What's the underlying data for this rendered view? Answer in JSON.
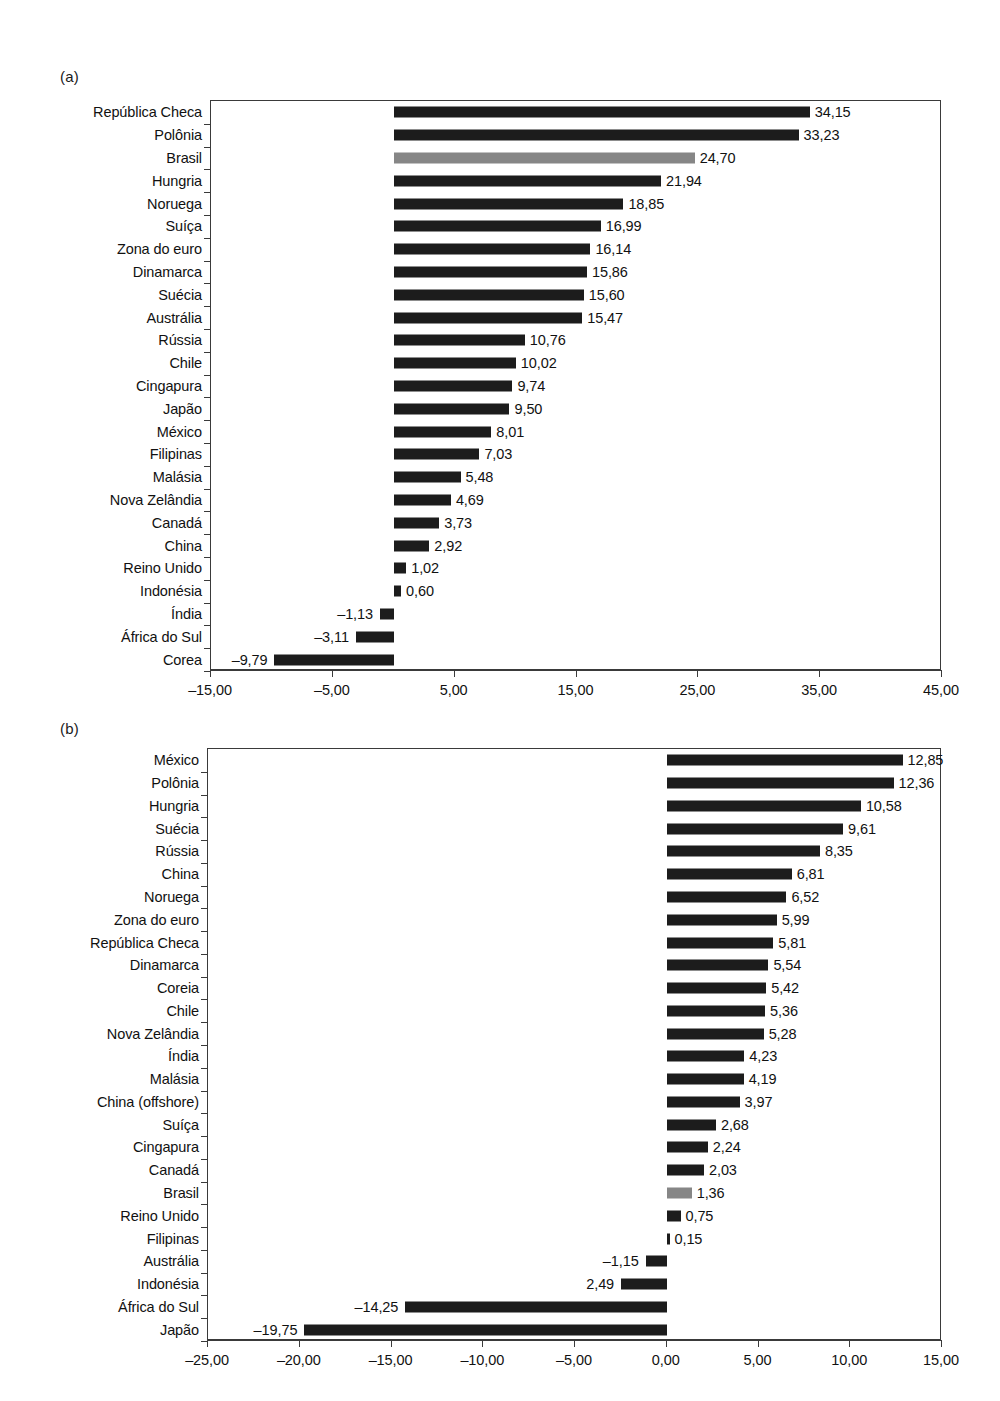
{
  "chart_data": [
    {
      "panel": "(a)",
      "type": "bar",
      "orientation": "horizontal",
      "title": "",
      "xlabel": "",
      "ylabel": "",
      "xlim": [
        -15.0,
        45.0
      ],
      "xticks": [
        -15.0,
        -5.0,
        5.0,
        15.0,
        25.0,
        35.0,
        45.0
      ],
      "xtick_labels": [
        "–15,00",
        "–5,00",
        "5,00",
        "15,00",
        "25,00",
        "35,00",
        "45,00"
      ],
      "grid": false,
      "legend": "none",
      "highlight_color": "#868686",
      "bar_color": "#1c1c1c",
      "categories": [
        "República Checa",
        "Polônia",
        "Brasil",
        "Hungria",
        "Noruega",
        "Suíça",
        "Zona do euro",
        "Dinamarca",
        "Suécia",
        "Austrália",
        "Rússia",
        "Chile",
        "Cingapura",
        "Japão",
        "México",
        "Filipinas",
        "Malásia",
        "Nova Zelândia",
        "Canadá",
        "China",
        "Reino Unido",
        "Indonésia",
        "Índia",
        "África do Sul",
        "Corea"
      ],
      "values": [
        34.15,
        33.23,
        24.7,
        21.94,
        18.85,
        16.99,
        16.14,
        15.86,
        15.6,
        15.47,
        10.76,
        10.02,
        9.74,
        9.5,
        8.01,
        7.03,
        5.48,
        4.69,
        3.73,
        2.92,
        1.02,
        0.6,
        -1.13,
        -3.11,
        -9.79
      ],
      "value_labels": [
        "34,15",
        "33,23",
        "24,70",
        "21,94",
        "18,85",
        "16,99",
        "16,14",
        "15,86",
        "15,60",
        "15,47",
        "10,76",
        "10,02",
        "9,74",
        "9,50",
        "8,01",
        "7,03",
        "5,48",
        "4,69",
        "3,73",
        "2,92",
        "1,02",
        "0,60",
        "–1,13",
        "–3,11",
        "–9,79"
      ],
      "highlighted": [
        "Brasil"
      ]
    },
    {
      "panel": "(b)",
      "type": "bar",
      "orientation": "horizontal",
      "title": "",
      "xlabel": "",
      "ylabel": "",
      "xlim": [
        -25.0,
        15.0
      ],
      "xticks": [
        -25.0,
        -20.0,
        -15.0,
        -10.0,
        -5.0,
        0.0,
        5.0,
        10.0,
        15.0
      ],
      "xtick_labels": [
        "–25,00",
        "–20,00",
        "–15,00",
        "–10,00",
        "–5,00",
        "0,00",
        "5,00",
        "10,00",
        "15,00"
      ],
      "grid": false,
      "legend": "none",
      "highlight_color": "#868686",
      "bar_color": "#1c1c1c",
      "categories": [
        "México",
        "Polônia",
        "Hungria",
        "Suécia",
        "Rússia",
        "China",
        "Noruega",
        "Zona do euro",
        "República Checa",
        "Dinamarca",
        "Coreia",
        "Chile",
        "Nova Zelândia",
        "Índia",
        "Malásia",
        "China (offshore)",
        "Suíça",
        "Cingapura",
        "Canadá",
        "Brasil",
        "Reino Unido",
        "Filipinas",
        "Austrália",
        "Indonésia",
        "África do Sul",
        "Japão"
      ],
      "values": [
        12.85,
        12.36,
        10.58,
        9.61,
        8.35,
        6.81,
        6.52,
        5.99,
        5.81,
        5.54,
        5.42,
        5.36,
        5.28,
        4.23,
        4.19,
        3.97,
        2.68,
        2.24,
        2.03,
        1.36,
        0.75,
        0.15,
        -1.15,
        -2.49,
        -14.25,
        -19.75
      ],
      "value_labels": [
        "12,85",
        "12,36",
        "10,58",
        "9,61",
        "8,35",
        "6,81",
        "6,52",
        "5,99",
        "5,81",
        "5,54",
        "5,42",
        "5,36",
        "5,28",
        "4,23",
        "4,19",
        "3,97",
        "2,68",
        "2,24",
        "2,03",
        "1,36",
        "0,75",
        "0,15",
        "–1,15",
        "2,49",
        "–14,25",
        "–19,75"
      ],
      "highlighted": [
        "Brasil"
      ]
    }
  ]
}
